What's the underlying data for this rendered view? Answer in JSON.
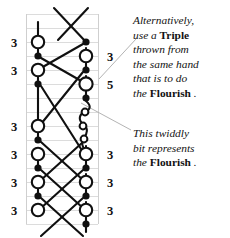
{
  "diagram": {
    "type": "juggling-ladder-diagram",
    "title": "",
    "grid": {
      "left_rail_x": 38,
      "right_rail_x": 86,
      "top": 14,
      "bottom": 224,
      "row_height": 14,
      "rows": 15,
      "rail_color": "#d8d8d8",
      "frame_color": "#c9c9c9"
    },
    "colors": {
      "ink": "#111111",
      "grid": "#d8d8d8",
      "leader": "#b0b0b0",
      "text": "#121212"
    },
    "left_throw_labels": [
      "3",
      "3",
      "3",
      "3",
      "3",
      "3"
    ],
    "right_throw_labels": [
      "3",
      "5",
      "3",
      "3",
      "3"
    ],
    "left_label_x": 14,
    "right_label_x": 96,
    "left_label_ys": [
      42,
      70,
      140,
      168,
      182,
      210
    ],
    "right_label_ys": [
      56,
      84,
      154,
      182,
      210
    ],
    "open_circle_radius": 6.2,
    "filled_dot_radius": 3.4,
    "twiddle_circle_radius": 3.4,
    "left_hand_nodes": [
      {
        "y": 42,
        "type": "open"
      },
      {
        "y": 56,
        "type": "filled"
      },
      {
        "y": 70,
        "type": "open"
      },
      {
        "y": 84,
        "type": "filled"
      },
      {
        "y": 126,
        "type": "open"
      },
      {
        "y": 140,
        "type": "filled"
      },
      {
        "y": 154,
        "type": "open"
      },
      {
        "y": 168,
        "type": "filled"
      },
      {
        "y": 182,
        "type": "open"
      },
      {
        "y": 196,
        "type": "filled"
      },
      {
        "y": 210,
        "type": "open"
      }
    ],
    "right_hand_nodes": [
      {
        "y": 42,
        "type": "filled"
      },
      {
        "y": 56,
        "type": "open"
      },
      {
        "y": 70,
        "type": "filled"
      },
      {
        "y": 84,
        "type": "open"
      },
      {
        "y": 98,
        "type": "filled"
      },
      {
        "y": 154,
        "type": "open"
      },
      {
        "y": 140,
        "type": "filled"
      },
      {
        "y": 168,
        "type": "filled"
      },
      {
        "y": 182,
        "type": "open"
      },
      {
        "y": 196,
        "type": "filled"
      },
      {
        "y": 210,
        "type": "open"
      },
      {
        "y": 224,
        "type": "filled"
      }
    ],
    "twiddle_circles": [
      {
        "cx": 84,
        "cy": 112
      },
      {
        "cx": 82,
        "cy": 126
      }
    ],
    "leader_lines": [
      {
        "x1": 99,
        "y1": 79,
        "x2": 136,
        "y2": 39,
        "points_to": "note-a"
      },
      {
        "x1": 81,
        "y1": 103,
        "x2": 131,
        "y2": 130,
        "points_to": "note-b"
      }
    ]
  },
  "notes": {
    "note_a": {
      "line1": "Alternatively,",
      "line2_pre": "use a ",
      "line2_bold": "Triple",
      "line3": "thrown from",
      "line4": "the same hand",
      "line5": "that is to do",
      "line6_pre": "the ",
      "line6_bold": "Flourish",
      "line6_post": " ."
    },
    "note_b": {
      "line1": "This twiddly",
      "line2": "bit represents",
      "line3_pre": "the ",
      "line3_bold": "Flourish",
      "line3_post": " ."
    }
  }
}
